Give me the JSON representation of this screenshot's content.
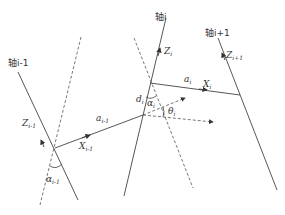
{
  "diagram": {
    "type": "DH link coordinate frames",
    "axes": [
      {
        "label": "轴i-1",
        "z_label": "Z",
        "z_sub": "i-1"
      },
      {
        "label": "轴i",
        "z_label": "Z",
        "z_sub": "i"
      },
      {
        "label": "轴i+1",
        "z_label": "Z",
        "z_sub": "i+1"
      }
    ],
    "links": [
      {
        "length_label": "a",
        "length_sub": "i-1",
        "x_label": "X",
        "x_sub": "i-1"
      },
      {
        "length_label": "a",
        "length_sub": "i",
        "x_label": "X",
        "x_sub": "i"
      }
    ],
    "params": {
      "twist_prev": {
        "sym": "α",
        "sub": "i-1"
      },
      "twist": {
        "sym": "α",
        "sub": "i"
      },
      "offset": {
        "sym": "d",
        "sub": "i"
      },
      "angle": {
        "sym": "θ",
        "sub": "i"
      }
    },
    "colors": {
      "line": "#444444",
      "dash": "#555555",
      "text": "#333333"
    }
  }
}
